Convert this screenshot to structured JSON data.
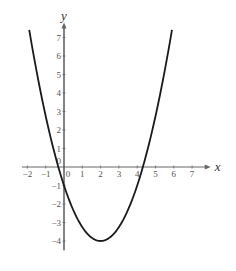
{
  "chart_data": {
    "type": "line",
    "title": "",
    "xlabel": "x",
    "ylabel": "y",
    "function": "y = 0.75x^2 - 3x - 1",
    "xlim": [
      -2.3,
      7.8
    ],
    "ylim": [
      -4.5,
      7.6
    ],
    "grid": false,
    "x_ticks": [
      "-2",
      "-1",
      "0",
      "1",
      "2",
      "3",
      "4",
      "5",
      "6",
      "7"
    ],
    "y_ticks_positive": [
      "1",
      "2",
      "3",
      "4",
      "5",
      "6",
      "7"
    ],
    "y_ticks_negative": [
      "-1",
      "-2",
      "-3",
      "-4"
    ],
    "origin_label": "0",
    "series": [
      {
        "name": "parabola",
        "x": [
          -1.9,
          -1.5,
          -1,
          -0.5,
          0,
          0.5,
          1,
          1.5,
          2,
          2.5,
          3,
          3.5,
          4,
          4.5,
          5,
          5.5,
          5.9
        ],
        "y": [
          7.41,
          5.19,
          2.75,
          0.69,
          -1,
          -2.31,
          -3.25,
          -3.81,
          -4,
          -3.81,
          -3.25,
          -2.31,
          -1,
          0.69,
          2.75,
          5.19,
          7.41
        ]
      }
    ],
    "key_points": {
      "vertex": [
        2,
        -4
      ],
      "y_intercept": [
        0,
        -1
      ],
      "roots": [
        -0.31,
        4.31
      ]
    },
    "colors": {
      "curve": "#1a1a1a",
      "axes": "#666666"
    }
  }
}
